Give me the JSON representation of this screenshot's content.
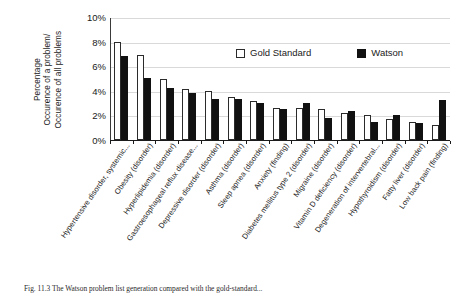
{
  "chart_data": {
    "type": "bar",
    "title": "",
    "xlabel": "",
    "ylabel": "Percentage Occurence of a problem/ Occurence of all problems",
    "ylabel_lines": [
      "Percentage",
      "Occurence of a problem/",
      "Occurence of all problems"
    ],
    "ylim": [
      0,
      10
    ],
    "yticks": [
      0,
      2,
      4,
      6,
      8,
      10
    ],
    "ytick_labels": [
      "0%",
      "2%",
      "4%",
      "6%",
      "8%",
      "10%"
    ],
    "grid": true,
    "grid_axis": "y",
    "legend_position": "upper-center-inside",
    "categories": [
      "Hypertensive disorder, systemic...",
      "Obesity (disorder)",
      "Hyperlipidemia (disorder)",
      "Gastroesophageal reflux disease...",
      "Depressive disorder (disorder)",
      "Asthma (disorder)",
      "Sleep apnea (disorder)",
      "Anxiety (finding)",
      "Diabetes mellitus type 2 (disorder)",
      "Migraine (disorder)",
      "Vitamin D deficiency (disorder)",
      "Degeneration of intervertebral...",
      "Hypothyroidism (disorder)",
      "Fatty liver (disorder)",
      "Low back pain (finding)"
    ],
    "series": [
      {
        "name": "Gold Standard",
        "color": "#ffffff",
        "edge_color": "#2b2b2b",
        "values": [
          8.05,
          6.95,
          5.0,
          4.15,
          4.0,
          3.5,
          3.2,
          2.6,
          2.6,
          2.55,
          2.25,
          2.05,
          1.75,
          1.5,
          1.25
        ]
      },
      {
        "name": "Watson",
        "color": "#111111",
        "edge_color": "#111111",
        "values": [
          6.85,
          5.1,
          4.25,
          3.85,
          3.35,
          3.35,
          3.0,
          2.55,
          3.05,
          1.8,
          2.35,
          1.45,
          2.05,
          1.4,
          3.3
        ]
      }
    ]
  },
  "legend": {
    "items": [
      {
        "label": "Gold Standard",
        "swatch": "open-square-swatch"
      },
      {
        "label": "Watson",
        "swatch": "filled-square-swatch"
      }
    ]
  },
  "caption": {
    "text": "Fig. 11.3  The Watson problem list generation compared with the gold-standard..."
  }
}
